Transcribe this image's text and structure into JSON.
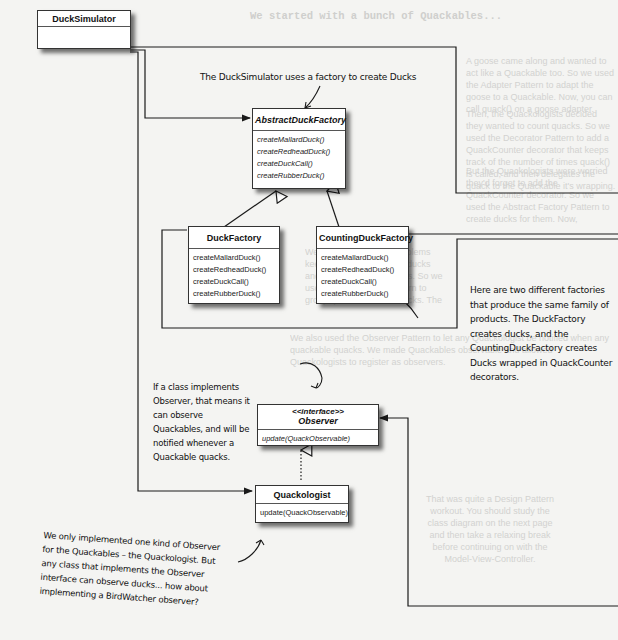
{
  "background_text": {
    "heading": "We started with a bunch of Quackables...",
    "para1": "A goose came along and wanted to act like a Quackable too. So we used the Adapter Pattern to adapt the goose to a Quackable. Now, you can call quack() on a goose adapter.",
    "para2": "Then, the Quackologists decided they wanted to count quacks. So we used the Decorator Pattern to add a QuackCounter decorator that keeps track of the number of times quack() is called, and then delegates the quack to the Quackable it's wrapping.",
    "para3": "But the Quackologists were worried they'd forget to add the QuackCounter decorator. So we used the Abstract Factory Pattern to create ducks for them. Now, whenever they want a duck, they ask the factory for one, and it hands back a decorated duck.",
    "para4": "We had management problems keeping track of all those ducks and geese and quackables. So we used the Composite Pattern to group quackables into Flocks. The pattern also allows the quackologist to create sub-Flocks to manage duck families.",
    "para5": "We also used the Observer Pattern to let any Quackologist be notified when any quackable quacks. We made Quackables observable and allowed Quackologists to register as observers.",
    "bubble": "That was quite a Design Pattern workout. You should study the class diagram on the next page and then take a relaxing break before continuing on with the Model-View-Controller."
  },
  "classes": {
    "duck_simulator": {
      "name": "DuckSimulator"
    },
    "abstract_factory": {
      "name": "AbstractDuckFactory",
      "methods": [
        "createMallardDuck()",
        "createRedheadDuck()",
        "createDuckCall()",
        "createRubberDuck()"
      ]
    },
    "duck_factory": {
      "name": "DuckFactory",
      "methods": [
        "createMallardDuck()",
        "createRedheadDuck()",
        "createDuckCall()",
        "createRubberDuck()"
      ]
    },
    "counting_factory": {
      "name": "CountingDuckFactory",
      "methods": [
        "createMallardDuck()",
        "createRedheadDuck()",
        "createDuckCall()",
        "createRubberDuck()"
      ]
    },
    "observer": {
      "stereotype": "<<interface>>",
      "name": "Observer",
      "methods": [
        "update(QuackObservable)"
      ]
    },
    "quackologist": {
      "name": "Quackologist",
      "methods": [
        "update(QuackObservable)"
      ]
    }
  },
  "annotations": {
    "factory_note": "The DuckSimulator uses a factory to create Ducks",
    "two_factories_note": "Here are two different factories that produce the same family of products. The DuckFactory creates ducks, and the CountingDuckFactory creates Ducks wrapped in QuackCounter decorators.",
    "observer_note": "If a class implements Observer, that means it can observe Quackables, and will be notified whenever a Quackable quacks.",
    "quackologist_note": "We only implemented one kind of Observer for the Quackables – the Quackologist. But any class that implements the Observer interface can observe ducks... how about implementing a BirdWatcher observer?"
  },
  "colors": {
    "line": "#1a1a1a",
    "background": "#f4f4f2",
    "faded_text": "#d2d2d0"
  }
}
